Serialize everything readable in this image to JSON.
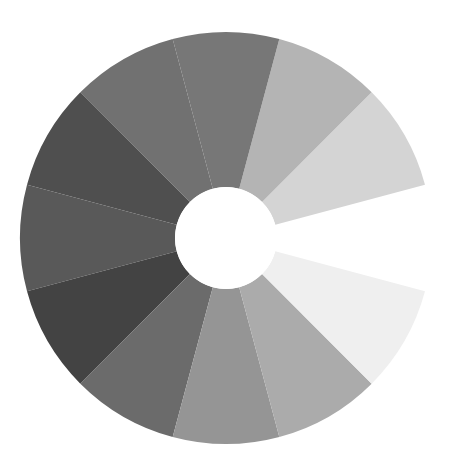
{
  "figure": {
    "type": "value-scale-wheel",
    "center": [
      226,
      238
    ],
    "outer_radius": 206,
    "inner_radius": 51,
    "wedges": [
      {
        "start": -15,
        "end": 15,
        "color": "#ffffff"
      },
      {
        "start": 15,
        "end": 45,
        "color": "#d4d4d4"
      },
      {
        "start": 45,
        "end": 75,
        "color": "#b4b4b4"
      },
      {
        "start": 75,
        "end": 105,
        "color": "#777777"
      },
      {
        "start": 105,
        "end": 135,
        "color": "#717171"
      },
      {
        "start": 135,
        "end": 165,
        "color": "#4f4f4f"
      },
      {
        "start": 165,
        "end": 195,
        "color": "#595959"
      },
      {
        "start": 195,
        "end": 225,
        "color": "#434343"
      },
      {
        "start": 225,
        "end": 255,
        "color": "#6b6b6b"
      },
      {
        "start": 255,
        "end": 285,
        "color": "#959595"
      },
      {
        "start": 285,
        "end": 315,
        "color": "#ababab"
      },
      {
        "start": 315,
        "end": 345,
        "color": "#efefef"
      }
    ]
  }
}
